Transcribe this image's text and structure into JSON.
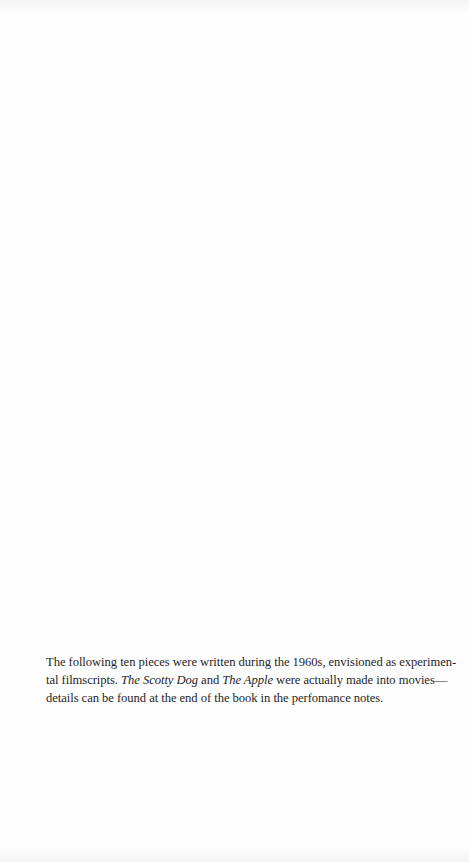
{
  "page": {
    "background_color": "#fefefe",
    "text_color": "#1e1e1e"
  },
  "prefatory_note": {
    "lines": [
      {
        "segments": [
          {
            "text": "The following ten pieces were written during the 1960s, envisioned as experimen-",
            "italic": false
          }
        ]
      },
      {
        "segments": [
          {
            "text": "tal filmscripts. ",
            "italic": false
          },
          {
            "text": "The Scotty Dog",
            "italic": true
          },
          {
            "text": " and ",
            "italic": false
          },
          {
            "text": "The Apple",
            "italic": true
          },
          {
            "text": " were actually made into movies—",
            "italic": false
          }
        ]
      },
      {
        "segments": [
          {
            "text": "details can be found at the end of the book in the perfomance notes.",
            "italic": false
          }
        ]
      }
    ],
    "full_text": "The following ten pieces were written during the 1960s, envisioned as experimental filmscripts. The Scotty Dog and The Apple were actually made into movies—details can be found at the end of the book in the perfomance notes.",
    "italic_titles": [
      "The Scotty Dog",
      "The Apple"
    ]
  }
}
